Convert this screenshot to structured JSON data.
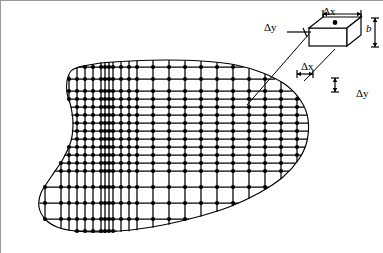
{
  "figure": {
    "kind": "engineering-diagram",
    "background_color": "#ffffff",
    "line_color": "#000000",
    "frame_color": "#9a9a9a"
  },
  "labels": {
    "detail_delta_y": "Δy",
    "detail_delta_x": "Δx",
    "detail_thickness": "b",
    "grid_delta_x": "Δx",
    "grid_delta_y": "Δy"
  },
  "chart_data": {
    "type": "diagram",
    "title": "",
    "grid": {
      "x_lines": [
        28,
        44,
        60,
        68,
        76,
        84,
        92,
        100,
        104,
        108,
        112,
        120,
        128,
        136,
        152,
        168,
        184,
        200,
        216,
        232,
        248,
        264,
        280,
        296,
        312
      ],
      "y_lines": [
        66,
        78,
        90,
        98,
        106,
        114,
        122,
        130,
        138,
        146,
        154,
        162,
        170,
        186,
        202,
        218,
        230
      ],
      "node_marker": "filled-circle",
      "node_radius_px": 2.1,
      "line_width_px": 1.3
    },
    "hull_outline": {
      "closed": true,
      "comment": "Approximate waterplane half-breadth curve traced over the grid",
      "points": [
        [
          78,
          66
        ],
        [
          100,
          62
        ],
        [
          130,
          60
        ],
        [
          165,
          59
        ],
        [
          200,
          60
        ],
        [
          235,
          64
        ],
        [
          262,
          72
        ],
        [
          285,
          84
        ],
        [
          300,
          100
        ],
        [
          307,
          118
        ],
        [
          306,
          140
        ],
        [
          298,
          158
        ],
        [
          282,
          176
        ],
        [
          258,
          192
        ],
        [
          228,
          206
        ],
        [
          196,
          216
        ],
        [
          162,
          224
        ],
        [
          130,
          229
        ],
        [
          100,
          231
        ],
        [
          74,
          230
        ],
        [
          56,
          226
        ],
        [
          44,
          218
        ],
        [
          38,
          206
        ],
        [
          40,
          192
        ],
        [
          50,
          176
        ],
        [
          62,
          158
        ],
        [
          70,
          140
        ],
        [
          72,
          122
        ],
        [
          70,
          106
        ],
        [
          66,
          92
        ],
        [
          66,
          80
        ],
        [
          70,
          70
        ],
        [
          78,
          66
        ]
      ]
    },
    "detail_box": {
      "shape": "rectangular-parallelepiped",
      "front_face": {
        "x": 308,
        "y": 27,
        "w": 38,
        "h": 18
      },
      "depth_dx": 14,
      "depth_dy": -11,
      "center_dot": true,
      "dimension_annotations": [
        {
          "name": "Δx",
          "axis": "horizontal",
          "position": "top"
        },
        {
          "name": "Δy",
          "axis": "oblique",
          "position": "left"
        },
        {
          "name": "b",
          "axis": "vertical",
          "position": "right"
        }
      ]
    },
    "grid_cell_callout": {
      "cell_x": [
        296,
        312
      ],
      "cell_y": [
        78,
        90
      ],
      "annotations": [
        {
          "name": "Δx",
          "axis": "horizontal"
        },
        {
          "name": "Δy",
          "axis": "vertical"
        }
      ]
    },
    "leader_lines": [
      {
        "from": [
          308,
          33
        ],
        "to": [
          246,
          104
        ]
      },
      {
        "from": [
          334,
          48
        ],
        "to": [
          303,
          80
        ]
      }
    ]
  }
}
